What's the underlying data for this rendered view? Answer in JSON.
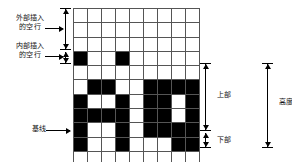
{
  "diagram": {
    "grid": {
      "cols": 9,
      "rows": 11,
      "on_color": "#000000",
      "off_color": "#ffffff",
      "line_color": "#555555",
      "cells": [
        [
          0,
          0,
          0,
          0,
          0,
          0,
          0,
          0,
          0
        ],
        [
          0,
          0,
          0,
          0,
          0,
          0,
          0,
          0,
          0
        ],
        [
          0,
          0,
          0,
          0,
          0,
          0,
          0,
          0,
          0
        ],
        [
          1,
          0,
          0,
          1,
          0,
          0,
          0,
          0,
          0
        ],
        [
          0,
          0,
          0,
          0,
          0,
          0,
          0,
          0,
          0
        ],
        [
          0,
          1,
          1,
          0,
          0,
          1,
          1,
          1,
          1
        ],
        [
          1,
          0,
          0,
          1,
          0,
          1,
          1,
          0,
          1
        ],
        [
          1,
          1,
          1,
          1,
          0,
          1,
          1,
          0,
          1
        ],
        [
          1,
          0,
          0,
          1,
          0,
          1,
          1,
          1,
          1
        ],
        [
          1,
          0,
          0,
          1,
          0,
          0,
          0,
          1,
          1
        ],
        [
          0,
          0,
          0,
          0,
          0,
          0,
          0,
          0,
          0
        ]
      ]
    },
    "labels": {
      "outer_leading": {
        "line1": "外部插入",
        "line2": "的空行"
      },
      "inner_leading": {
        "line1": "内部插入",
        "line2": "的空行"
      },
      "baseline": "基线",
      "ascender": "上部",
      "descender": "下部",
      "height": "高度"
    }
  }
}
